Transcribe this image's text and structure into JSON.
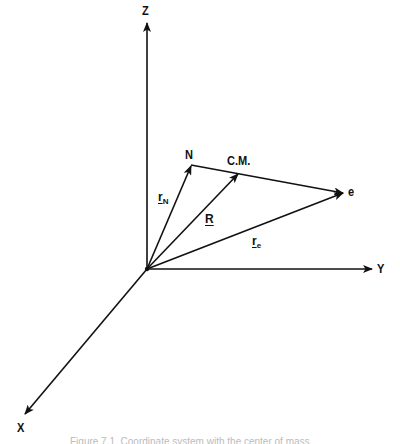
{
  "diagram": {
    "type": "3d-coordinate-vector-diagram",
    "axes": {
      "z": {
        "label": "Z"
      },
      "y": {
        "label": "Y"
      },
      "x": {
        "label": "X"
      }
    },
    "points": {
      "nucleus": {
        "label": "N"
      },
      "center_of_mass": {
        "label": "C.M."
      },
      "electron": {
        "label": "e"
      }
    },
    "vectors": {
      "r_N": {
        "symbol": "r",
        "subscript": "N"
      },
      "R": {
        "symbol": "R",
        "subscript": ""
      },
      "r_e": {
        "symbol": "r",
        "subscript": "e"
      }
    },
    "colors": {
      "ink": "#111111",
      "background": "#ffffff"
    }
  },
  "caption": {
    "text": "Figure 7.1. Coordinate system with the center of mass",
    "truncated": true
  }
}
